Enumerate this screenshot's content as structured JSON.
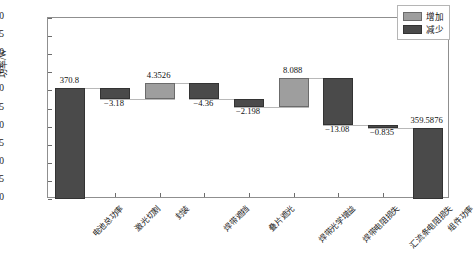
{
  "chart_data": {
    "type": "bar",
    "subtype": "waterfall",
    "title": "",
    "xlabel": "",
    "ylabel": "功率/W",
    "ylim": [
      340,
      390
    ],
    "ytick_step": 5,
    "yticks": [
      340,
      345,
      350,
      355,
      360,
      365,
      370,
      375,
      380,
      385,
      390
    ],
    "grid": false,
    "legend_position": "top-right",
    "legend": [
      {
        "key": "increase",
        "label": "增加",
        "color": "#9e9e9e"
      },
      {
        "key": "decrease",
        "label": "减少",
        "color": "#4a4a4a"
      }
    ],
    "categories": [
      "电池总功率",
      "激光切割",
      "封装",
      "焊带遮挡",
      "叠片遮光",
      "焊带光学增益",
      "焊带电阻损失",
      "汇流条电阻损失",
      "组件功率"
    ],
    "values": [
      370.8,
      -3.18,
      4.3526,
      -4.36,
      -2.198,
      8.088,
      -13.08,
      -0.835,
      359.5876
    ],
    "value_labels": [
      "370.8",
      "−3.18",
      "4.3526",
      "−4.36",
      "−2.198",
      "8.088",
      "−13.08",
      "−0.835",
      "359.5876"
    ],
    "bar_kinds": [
      "total",
      "decrease",
      "increase",
      "decrease",
      "decrease",
      "increase",
      "decrease",
      "decrease",
      "total"
    ],
    "bar_bases": [
      340,
      367.62,
      367.62,
      367.6,
      365.402,
      365.402,
      360.4114,
      359.5764,
      340
    ],
    "bar_tops": [
      370.8,
      370.8,
      371.9726,
      371.96,
      367.6,
      373.49,
      373.4914,
      360.4114,
      359.5876
    ]
  },
  "colors": {
    "increase": "#9e9e9e",
    "decrease": "#4a4a4a",
    "frame": "#8f8f8f",
    "text": "#111111",
    "connector": "#b8b8b8"
  }
}
